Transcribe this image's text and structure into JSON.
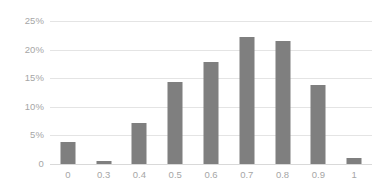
{
  "chart_data": {
    "type": "bar",
    "title": "",
    "subtitle": "",
    "xlabel": "",
    "ylabel": "",
    "categories": [
      "0",
      "0.3",
      "0.4",
      "0.5",
      "0.6",
      "0.7",
      "0.8",
      "0.9",
      "1"
    ],
    "values": [
      3.8,
      0.5,
      7.2,
      14.3,
      17.8,
      22.2,
      21.5,
      13.8,
      1.0
    ],
    "value_format": "percent",
    "ylim": [
      0,
      25
    ],
    "y_ticks": [
      {
        "value": 25,
        "label": "25%"
      },
      {
        "value": 20,
        "label": "20%"
      },
      {
        "value": 15,
        "label": "15%"
      },
      {
        "value": 10,
        "label": "10%"
      },
      {
        "value": 5,
        "label": "5%"
      },
      {
        "value": 0,
        "label": "0"
      }
    ],
    "x_ticks": [
      "0",
      "0.3",
      "0.4",
      "0.5",
      "0.6",
      "0.7",
      "0.8",
      "0.9",
      "1"
    ],
    "grid": "horizontal",
    "legend": "none",
    "series": [
      {
        "name": "",
        "values": [
          3.8,
          0.5,
          7.2,
          14.3,
          17.8,
          22.2,
          21.5,
          13.8,
          1.0
        ]
      }
    ],
    "colors": {
      "bar": "#7f7f7f",
      "gridline": "#e4e4e4",
      "axis": "#d9d9d9",
      "tick_label": "#a6a6a6",
      "background": "#ffffff"
    }
  }
}
